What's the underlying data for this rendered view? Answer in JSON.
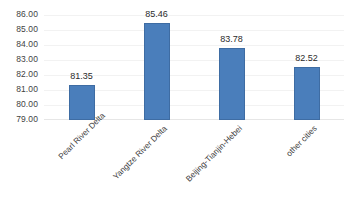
{
  "chart_data": {
    "type": "bar",
    "title": "",
    "xlabel": "",
    "ylabel": "",
    "categories": [
      "Pearl River Delta",
      "Yangtze River Delta",
      "Beijing-Tianjin-Hebei",
      "other cities"
    ],
    "values": [
      81.35,
      85.46,
      83.78,
      82.52
    ],
    "value_labels": [
      "81.35",
      "85.46",
      "83.78",
      "82.52"
    ],
    "ylim": [
      79.0,
      86.0
    ],
    "ytick_labels": [
      "86.00",
      "85.00",
      "84.00",
      "83.00",
      "82.00",
      "81.00",
      "80.00",
      "79.00"
    ],
    "ytick_values": [
      86.0,
      85.0,
      84.0,
      83.0,
      82.0,
      81.0,
      80.0,
      79.0
    ],
    "grid": true,
    "legend": false,
    "bar_color": "#4a7ebb",
    "bar_border_color": "#3e6ca3",
    "background_color": "#ffffff",
    "gridline_color": "#f2f2f2",
    "label_rotation": -45
  }
}
